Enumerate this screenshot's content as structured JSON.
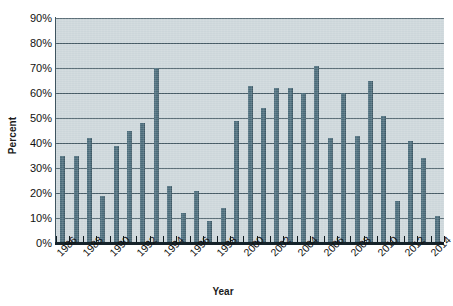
{
  "chart_data": {
    "type": "bar",
    "title": "",
    "xlabel": "Year",
    "ylabel": "Percent",
    "ylim": [
      0,
      90
    ],
    "ytick_labels": [
      "0%",
      "10%",
      "20%",
      "30%",
      "40%",
      "50%",
      "60%",
      "70%",
      "80%",
      "90%"
    ],
    "ytick_values": [
      0,
      10,
      20,
      30,
      40,
      50,
      60,
      70,
      80,
      90
    ],
    "grid": "horizontal",
    "legend": "none",
    "xtick_labels": [
      "1986",
      "1988",
      "1990",
      "1992",
      "1994",
      "1996",
      "1998",
      "2000",
      "2002",
      "2004",
      "2006",
      "2008",
      "2010",
      "2012",
      "2014"
    ],
    "categories": [
      "1986",
      "1987",
      "1988",
      "1989",
      "1990",
      "1991",
      "1992",
      "1993",
      "1994",
      "1995",
      "1996",
      "1997",
      "1998",
      "1999",
      "2000",
      "2001",
      "2002",
      "2003",
      "2004",
      "2005",
      "2006",
      "2007",
      "2008",
      "2009",
      "2010",
      "2011",
      "2012",
      "2013",
      "2014"
    ],
    "values": [
      35,
      35,
      42,
      19,
      39,
      45,
      48,
      70,
      23,
      12,
      21,
      9,
      14,
      49,
      63,
      54,
      62,
      62,
      60,
      71,
      42,
      60,
      43,
      65,
      51,
      17,
      41,
      34,
      11
    ],
    "bar_color": "#4a6b7a",
    "plot_background": "#ccd6da",
    "gridline_color": "#3f5560"
  }
}
